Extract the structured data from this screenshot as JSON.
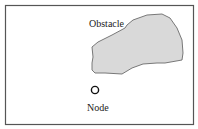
{
  "diagram": {
    "obstacle": {
      "label": "Obstacle",
      "fill": "#d9d9d9",
      "stroke": "#6b6b6b"
    },
    "node": {
      "label": "Node",
      "stroke": "#111111"
    },
    "frame": {
      "stroke": "#555555"
    }
  }
}
